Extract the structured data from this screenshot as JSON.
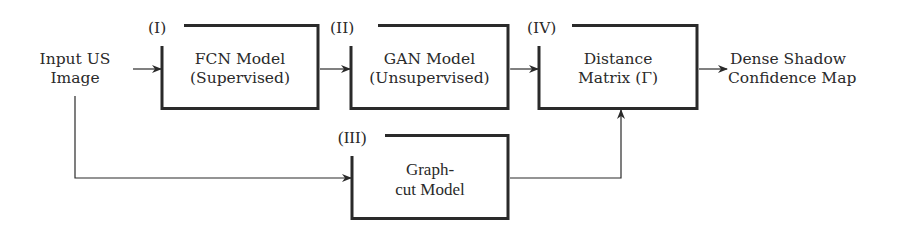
{
  "diagram": {
    "input": {
      "line1": "Input US",
      "line2": "Image"
    },
    "output": {
      "line1": "Dense Shadow",
      "line2": "Confidence Map"
    },
    "boxes": [
      {
        "id": "I",
        "tag": "(I)",
        "line1": "FCN Model",
        "line2": "(Supervised)"
      },
      {
        "id": "II",
        "tag": "(II)",
        "line1": "GAN Model",
        "line2": "(Unsupervised)"
      },
      {
        "id": "III",
        "tag": "(III)",
        "line1": "Graph-",
        "line2": "cut Model"
      },
      {
        "id": "IV",
        "tag": "(IV)",
        "line1": "Distance",
        "line2": "Matrix (Γ)"
      }
    ],
    "edges": [
      {
        "from": "input",
        "to": "I"
      },
      {
        "from": "I",
        "to": "II"
      },
      {
        "from": "II",
        "to": "IV"
      },
      {
        "from": "IV",
        "to": "output"
      },
      {
        "from": "input",
        "to": "III"
      },
      {
        "from": "III",
        "to": "IV"
      }
    ],
    "colors": {
      "line": "#2a2a2a",
      "background": "#ffffff"
    }
  }
}
